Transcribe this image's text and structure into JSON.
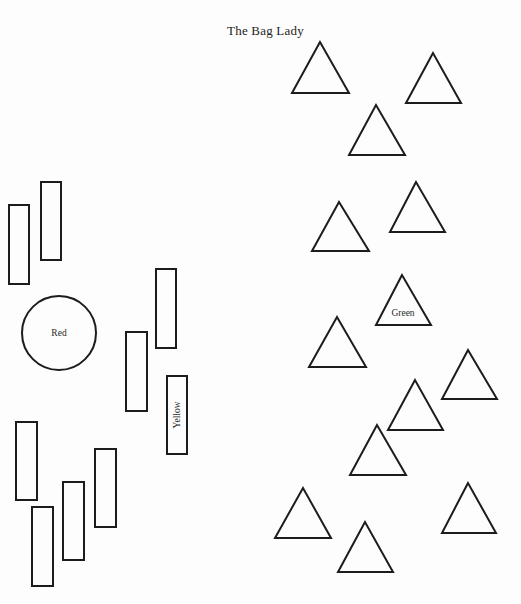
{
  "title": "The Bag Lady",
  "shapes": {
    "rectangles": [
      {
        "id": "rect-1",
        "label": ""
      },
      {
        "id": "rect-2",
        "label": ""
      },
      {
        "id": "rect-3",
        "label": ""
      },
      {
        "id": "rect-4",
        "label": ""
      },
      {
        "id": "rect-yellow",
        "label": "Yellow"
      },
      {
        "id": "rect-6",
        "label": ""
      },
      {
        "id": "rect-7",
        "label": ""
      },
      {
        "id": "rect-8",
        "label": ""
      },
      {
        "id": "rect-9",
        "label": ""
      }
    ],
    "circles": [
      {
        "id": "circle-red",
        "label": "Red"
      }
    ],
    "triangles": [
      {
        "id": "tri-1",
        "label": ""
      },
      {
        "id": "tri-2",
        "label": ""
      },
      {
        "id": "tri-3",
        "label": ""
      },
      {
        "id": "tri-4",
        "label": ""
      },
      {
        "id": "tri-5",
        "label": ""
      },
      {
        "id": "tri-green",
        "label": "Green"
      },
      {
        "id": "tri-7",
        "label": ""
      },
      {
        "id": "tri-8",
        "label": ""
      },
      {
        "id": "tri-9",
        "label": ""
      },
      {
        "id": "tri-10",
        "label": ""
      },
      {
        "id": "tri-11",
        "label": ""
      },
      {
        "id": "tri-12",
        "label": ""
      },
      {
        "id": "tri-13",
        "label": ""
      }
    ]
  },
  "counts": {
    "rectangles": 9,
    "circles": 1,
    "triangles": 13
  }
}
